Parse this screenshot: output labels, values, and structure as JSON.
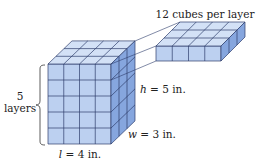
{
  "diagram": {
    "layer_label": "12 cubes per layer",
    "layers_count": "5",
    "layers_word": "layers",
    "height_var": "h",
    "height_val": " = 5 in.",
    "width_var": "w",
    "width_val": " = 3 in.",
    "length_var": "l",
    "length_val": " = 4 in.",
    "prism": {
      "length": 4,
      "width": 3,
      "height": 5
    },
    "slab": {
      "length": 4,
      "width": 3,
      "height": 1
    },
    "colors": {
      "front": "#bcd0f0",
      "top": "#d3e1f6",
      "side": "#86a6de",
      "edge": "#2e3d6b"
    }
  }
}
